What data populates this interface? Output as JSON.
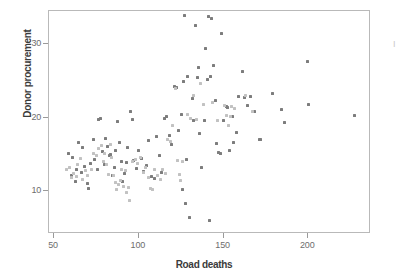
{
  "figure": {
    "background_color": "#ffffff",
    "frame_color": "#b9b9b9",
    "margin_note": "I"
  },
  "chart_data": {
    "type": "scatter",
    "title": "",
    "xlabel": "Road deaths",
    "ylabel": "Donor procurement",
    "xlim": [
      47,
      237
    ],
    "ylim": [
      4.2,
      34.5
    ],
    "xticks": [
      50,
      100,
      150,
      200
    ],
    "yticks": [
      10,
      20,
      30
    ],
    "grid": false,
    "legend": "none",
    "series": [
      {
        "name": "dark-points",
        "color": "#7d7d7d",
        "marker": "square",
        "points": [
          [
            58.5,
            15.2
          ],
          [
            60.0,
            12.1
          ],
          [
            61.0,
            14.6
          ],
          [
            62.5,
            11.3
          ],
          [
            63.5,
            13.0
          ],
          [
            64.5,
            16.7
          ],
          [
            66.0,
            12.6
          ],
          [
            67.0,
            15.9
          ],
          [
            68.0,
            13.4
          ],
          [
            69.5,
            11.0
          ],
          [
            70.5,
            10.4
          ],
          [
            71.5,
            13.8
          ],
          [
            73.0,
            17.0
          ],
          [
            74.0,
            14.3
          ],
          [
            75.5,
            12.9
          ],
          [
            76.5,
            19.8
          ],
          [
            77.5,
            19.9
          ],
          [
            78.5,
            15.4
          ],
          [
            79.5,
            13.6
          ],
          [
            80.5,
            17.2
          ],
          [
            81.5,
            16.1
          ],
          [
            82.5,
            14.9
          ],
          [
            83.5,
            15.0
          ],
          [
            84.5,
            12.2
          ],
          [
            85.5,
            13.3
          ],
          [
            86.5,
            15.6
          ],
          [
            87.5,
            19.5
          ],
          [
            88.5,
            16.6
          ],
          [
            89.5,
            14.1
          ],
          [
            90.5,
            11.4
          ],
          [
            91.5,
            12.4
          ],
          [
            92.5,
            13.9
          ],
          [
            93.5,
            16.0
          ],
          [
            95.0,
            20.9
          ],
          [
            96.0,
            19.7
          ],
          [
            97.0,
            14.2
          ],
          [
            98.5,
            13.1
          ],
          [
            100.0,
            15.5
          ],
          [
            101.5,
            14.5
          ],
          [
            103.0,
            12.7
          ],
          [
            104.5,
            13.5
          ],
          [
            106.0,
            16.9
          ],
          [
            107.5,
            12.0
          ],
          [
            109.0,
            11.8
          ],
          [
            110.5,
            17.4
          ],
          [
            112.0,
            14.8
          ],
          [
            113.5,
            12.5
          ],
          [
            115.0,
            19.9
          ],
          [
            116.5,
            20.1
          ],
          [
            118.0,
            17.6
          ],
          [
            119.5,
            16.4
          ],
          [
            121.0,
            24.2
          ],
          [
            122.0,
            24.1
          ],
          [
            123.5,
            18.2
          ],
          [
            125.0,
            20.5
          ],
          [
            125.5,
            10.2
          ],
          [
            126.5,
            24.9
          ],
          [
            127.0,
            33.9
          ],
          [
            127.5,
            8.3
          ],
          [
            128.0,
            14.3
          ],
          [
            129.0,
            25.6
          ],
          [
            130.0,
            6.4
          ],
          [
            131.5,
            22.6
          ],
          [
            132.5,
            19.6
          ],
          [
            133.5,
            32.5
          ],
          [
            134.5,
            25.4
          ],
          [
            135.5,
            26.8
          ],
          [
            136.0,
            17.9
          ],
          [
            137.0,
            13.3
          ],
          [
            138.5,
            19.6
          ],
          [
            139.5,
            29.4
          ],
          [
            140.5,
            25.2
          ],
          [
            141.0,
            33.8
          ],
          [
            141.5,
            6.0
          ],
          [
            142.5,
            25.6
          ],
          [
            143.0,
            33.5
          ],
          [
            144.0,
            27.1
          ],
          [
            145.0,
            22.4
          ],
          [
            146.0,
            16.5
          ],
          [
            147.0,
            15.3
          ],
          [
            148.0,
            15.2
          ],
          [
            149.0,
            31.5
          ],
          [
            150.0,
            19.6
          ],
          [
            151.5,
            21.5
          ],
          [
            152.5,
            21.4
          ],
          [
            153.5,
            15.5
          ],
          [
            155.0,
            20.2
          ],
          [
            156.0,
            16.7
          ],
          [
            157.5,
            18.0
          ],
          [
            159.0,
            22.9
          ],
          [
            161.0,
            26.3
          ],
          [
            162.5,
            22.8
          ],
          [
            164.0,
            21.6
          ],
          [
            166.0,
            22.9
          ],
          [
            168.5,
            20.9
          ],
          [
            171.0,
            17.1
          ],
          [
            172.0,
            17.0
          ],
          [
            179.0,
            23.3
          ],
          [
            184.0,
            21.1
          ],
          [
            186.0,
            19.3
          ],
          [
            199.5,
            27.7
          ],
          [
            200.0,
            21.8
          ],
          [
            227.0,
            20.3
          ]
        ]
      },
      {
        "name": "light-points",
        "color": "#c2c2c2",
        "marker": "square",
        "points": [
          [
            57.5,
            12.9
          ],
          [
            59.0,
            13.2
          ],
          [
            60.5,
            11.9
          ],
          [
            61.5,
            12.4
          ],
          [
            63.0,
            12.0
          ],
          [
            64.0,
            13.6
          ],
          [
            65.5,
            14.4
          ],
          [
            66.5,
            11.6
          ],
          [
            68.5,
            12.8
          ],
          [
            70.0,
            12.2
          ],
          [
            72.0,
            13.0
          ],
          [
            73.5,
            15.2
          ],
          [
            75.0,
            14.8
          ],
          [
            76.0,
            15.8
          ],
          [
            78.0,
            16.2
          ],
          [
            79.0,
            14.0
          ],
          [
            80.0,
            15.1
          ],
          [
            81.0,
            13.7
          ],
          [
            82.0,
            12.3
          ],
          [
            83.0,
            16.4
          ],
          [
            84.0,
            14.6
          ],
          [
            85.0,
            12.1
          ],
          [
            86.0,
            11.2
          ],
          [
            87.0,
            10.3
          ],
          [
            88.0,
            10.9
          ],
          [
            89.0,
            11.5
          ],
          [
            90.0,
            13.0
          ],
          [
            91.0,
            10.6
          ],
          [
            92.0,
            12.8
          ],
          [
            93.0,
            9.9
          ],
          [
            94.0,
            10.5
          ],
          [
            94.5,
            8.8
          ],
          [
            96.5,
            14.0
          ],
          [
            98.0,
            14.3
          ],
          [
            99.5,
            13.8
          ],
          [
            101.0,
            14.6
          ],
          [
            102.5,
            12.6
          ],
          [
            104.0,
            13.2
          ],
          [
            105.5,
            11.9
          ],
          [
            107.0,
            10.4
          ],
          [
            108.0,
            10.3
          ],
          [
            109.5,
            12.9
          ],
          [
            111.0,
            12.2
          ],
          [
            112.5,
            11.6
          ],
          [
            114.0,
            13.0
          ],
          [
            115.5,
            12.4
          ],
          [
            117.0,
            17.0
          ],
          [
            118.5,
            16.8
          ],
          [
            120.0,
            18.9
          ],
          [
            121.5,
            24.0
          ],
          [
            123.0,
            14.2
          ],
          [
            124.0,
            12.3
          ],
          [
            124.5,
            11.5
          ],
          [
            126.0,
            14.1
          ],
          [
            128.5,
            20.4
          ],
          [
            130.5,
            19.9
          ],
          [
            132.0,
            23.0
          ],
          [
            134.0,
            19.8
          ],
          [
            136.5,
            24.6
          ],
          [
            138.0,
            21.8
          ],
          [
            143.5,
            22.1
          ],
          [
            146.5,
            19.6
          ],
          [
            150.5,
            21.6
          ],
          [
            152.0,
            20.3
          ],
          [
            153.0,
            19.0
          ],
          [
            154.0,
            20.2
          ],
          [
            154.5,
            21.5
          ],
          [
            156.5,
            21.2
          ],
          [
            163.0,
            23.0
          ],
          [
            167.0,
            20.8
          ]
        ]
      }
    ]
  }
}
